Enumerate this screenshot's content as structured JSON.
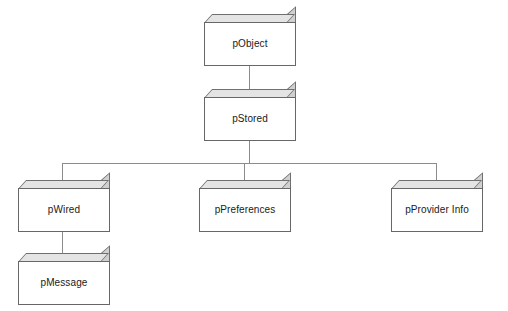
{
  "diagram": {
    "type": "class-hierarchy-tree",
    "title": "",
    "background_color": "#ffffff",
    "box_face_color": "#ffffff",
    "box_shade_color": "#d0d0d0",
    "box_border_color": "#676767",
    "connector_color": "#8c8c8c",
    "nodes": [
      {
        "id": "pObject",
        "label": "pObject",
        "level": 0,
        "x": 204,
        "y": 14,
        "w": 92,
        "h": 52
      },
      {
        "id": "pStored",
        "label": "pStored",
        "level": 1,
        "x": 204,
        "y": 89,
        "w": 92,
        "h": 52
      },
      {
        "id": "pWired",
        "label": "pWired",
        "level": 2,
        "x": 18,
        "y": 180,
        "w": 92,
        "h": 52
      },
      {
        "id": "pPreferences",
        "label": "pPreferences",
        "level": 2,
        "x": 199,
        "y": 180,
        "w": 92,
        "h": 52
      },
      {
        "id": "pProviderInfo",
        "label": "pProvider Info",
        "level": 2,
        "x": 391,
        "y": 180,
        "w": 92,
        "h": 52
      },
      {
        "id": "pMessage",
        "label": "pMessage",
        "level": 3,
        "x": 18,
        "y": 253,
        "w": 92,
        "h": 52
      }
    ],
    "edges": [
      {
        "from": "pObject",
        "to": "pStored"
      },
      {
        "from": "pStored",
        "to": "pWired"
      },
      {
        "from": "pStored",
        "to": "pPreferences"
      },
      {
        "from": "pStored",
        "to": "pProviderInfo"
      },
      {
        "from": "pWired",
        "to": "pMessage"
      }
    ]
  }
}
